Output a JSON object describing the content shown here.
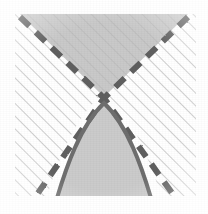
{
  "figure": {
    "title": "Hyperbola with asymptotes and shaded cone regions",
    "caption": "",
    "background_color": "#ffffff",
    "frame": {
      "x": 15,
      "y": 14,
      "width": 181,
      "height": 182
    }
  },
  "style": {
    "hatch_color": "#b9b9b9",
    "hatch_angle_deg": 45,
    "hatch_spacing_px": 9,
    "hatch_stroke_width": 1.4,
    "fill_gray": "#c9c9c9",
    "fill_gray_light": "#cfcfcf",
    "curve_color": "#6e6e6e",
    "dash_color": "#5f5f5f",
    "curve_stroke_width": 4.0,
    "dash_stroke_width": 6.0,
    "dash_pattern": "13 9"
  },
  "chart_data": {
    "type": "line",
    "title": "Hyperbola with asymptotes and shaded cone regions",
    "xlabel": "",
    "ylabel": "",
    "grid": false,
    "legend_position": "none",
    "axis_ranges": {
      "x": [
        15,
        196
      ],
      "y": [
        14,
        196
      ]
    },
    "center": {
      "x": 104,
      "y": 98,
      "label": "asymptote-crossing"
    },
    "vertex": {
      "x": 104,
      "y": 103,
      "label": "hyperbola-vertex"
    },
    "series": [
      {
        "name": "asymptote-descending",
        "style": "dashed",
        "color": "#5f5f5f",
        "points": [
          [
            20,
            17
          ],
          [
            104,
            98
          ],
          [
            172,
            193
          ]
        ]
      },
      {
        "name": "asymptote-ascending",
        "style": "dashed",
        "color": "#5f5f5f",
        "points": [
          [
            188,
            17
          ],
          [
            104,
            98
          ],
          [
            38,
            193
          ]
        ]
      },
      {
        "name": "hyperbola-lower-branch",
        "style": "solid",
        "color": "#6e6e6e",
        "points": [
          [
            57,
            196
          ],
          [
            72,
            156
          ],
          [
            88,
            120
          ],
          [
            104,
            103
          ],
          [
            120,
            120
          ],
          [
            136,
            156
          ],
          [
            152,
            196
          ]
        ]
      }
    ],
    "regions": [
      {
        "name": "upper-cone-region",
        "fill": "#c9c9c9",
        "hatched": true,
        "polygon": [
          [
            20,
            14
          ],
          [
            188,
            14
          ],
          [
            104,
            97
          ]
        ]
      },
      {
        "name": "hyperbola-interior-region",
        "fill": "#cfcfcf",
        "hatched": false,
        "description": "Area enclosed below the solid hyperbola branch down to the lower frame edge"
      },
      {
        "name": "hatched-background",
        "fill": "#ffffff",
        "hatched": true,
        "description": "Diagonal hatch lines at 45 degrees filling the full square frame"
      }
    ]
  }
}
